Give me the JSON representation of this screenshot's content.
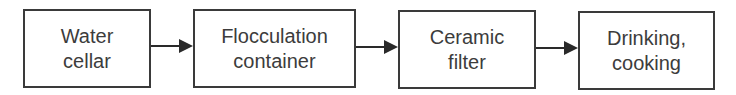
{
  "diagram": {
    "type": "flowchart",
    "direction": "left-to-right",
    "nodes": [
      {
        "id": "water-cellar",
        "lines": [
          "Water",
          "cellar"
        ]
      },
      {
        "id": "flocculation-container",
        "lines": [
          "Flocculation",
          "container"
        ]
      },
      {
        "id": "ceramic-filter",
        "lines": [
          "Ceramic",
          "filter"
        ]
      },
      {
        "id": "drinking-cooking",
        "lines": [
          "Drinking,",
          "cooking"
        ]
      }
    ],
    "edges": [
      {
        "from": "water-cellar",
        "to": "flocculation-container"
      },
      {
        "from": "flocculation-container",
        "to": "ceramic-filter"
      },
      {
        "from": "ceramic-filter",
        "to": "drinking-cooking"
      }
    ],
    "colors": {
      "stroke": "#3a3a3a",
      "text": "#3c3c3c",
      "background": "#ffffff"
    }
  }
}
